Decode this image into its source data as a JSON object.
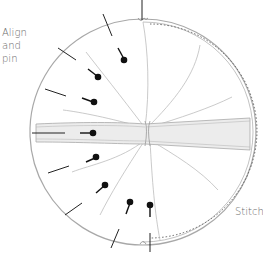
{
  "labels": {
    "align": [
      "Align",
      "and",
      "pin"
    ],
    "stitch": "Stitch"
  },
  "colors": {
    "outline": "#a8a8a8",
    "fold_lines": "#bdbdbd",
    "band_fill": "#ececec",
    "pins": "#111111",
    "text": "#6a6a6a"
  },
  "circle": {
    "cx": 143,
    "cy": 132,
    "r": 113
  },
  "pins": [
    {
      "head": [
        124,
        59
      ],
      "tail": [
        118,
        48
      ]
    },
    {
      "head": [
        97,
        76
      ],
      "tail": [
        88,
        69
      ]
    },
    {
      "head": [
        93,
        102
      ],
      "tail": [
        82,
        98
      ]
    },
    {
      "head": [
        93,
        133
      ],
      "tail": [
        80,
        133
      ]
    },
    {
      "head": [
        95,
        158
      ],
      "tail": [
        86,
        162
      ]
    },
    {
      "head": [
        105,
        186
      ],
      "tail": [
        96,
        193
      ]
    },
    {
      "head": [
        130,
        203
      ],
      "tail": [
        126,
        214
      ]
    },
    {
      "head": [
        150,
        205
      ],
      "tail": [
        150,
        217
      ]
    }
  ],
  "edge_marks": [
    {
      "from": [
        103,
        14
      ],
      "to": [
        112,
        36
      ]
    },
    {
      "from": [
        58,
        48
      ],
      "to": [
        76,
        60
      ]
    },
    {
      "from": [
        45,
        89
      ],
      "to": [
        66,
        96
      ]
    },
    {
      "from": [
        32,
        133
      ],
      "to": [
        65,
        133
      ]
    },
    {
      "from": [
        48,
        173
      ],
      "to": [
        69,
        166
      ]
    },
    {
      "from": [
        65,
        215
      ],
      "to": [
        82,
        203
      ]
    },
    {
      "from": [
        111,
        248
      ],
      "to": [
        119,
        229
      ]
    }
  ]
}
